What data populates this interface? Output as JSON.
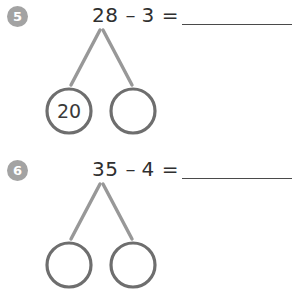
{
  "page": {
    "background_color": "#ffffff",
    "badge_color": "#a3a3a3",
    "badge_text_color": "#ffffff",
    "circle_stroke_color": "#6e6e6e",
    "branch_stroke_color": "#989898",
    "text_color": "#2f2f2f",
    "answer_line_color": "#4a4a4a"
  },
  "problems": [
    {
      "number": "5",
      "equation": {
        "left_operand": "28",
        "operator": "–",
        "right_operand": "3",
        "equals": "=",
        "answer": ""
      },
      "number_bond": {
        "left_circle_value": "20",
        "right_circle_value": ""
      }
    },
    {
      "number": "6",
      "equation": {
        "left_operand": "35",
        "operator": "–",
        "right_operand": "4",
        "equals": "=",
        "answer": ""
      },
      "number_bond": {
        "left_circle_value": "",
        "right_circle_value": ""
      }
    }
  ]
}
